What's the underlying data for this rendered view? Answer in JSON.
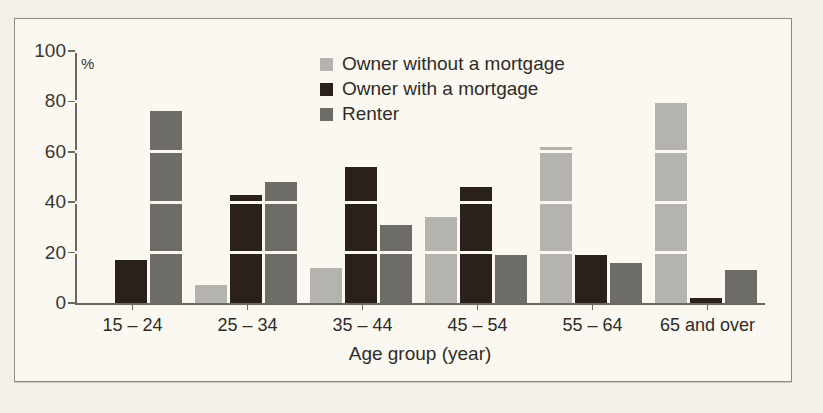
{
  "chart_data": {
    "type": "bar",
    "title": "",
    "xlabel": "Age group (year)",
    "ylabel": "%",
    "ylim": [
      0,
      100
    ],
    "yticks": [
      0,
      20,
      40,
      60,
      80,
      100
    ],
    "grid": true,
    "legend_position": "top-center",
    "categories": [
      "15 – 24",
      "25 – 34",
      "35 – 44",
      "45 – 54",
      "55 – 64",
      "65 and over"
    ],
    "series": [
      {
        "name": "Owner without a mortgage",
        "color": "#b5b3ad",
        "values": [
          0,
          7,
          14,
          34,
          62,
          80
        ]
      },
      {
        "name": "Owner with a mortgage",
        "color": "#2a201c",
        "values": [
          17,
          43,
          54,
          46,
          19,
          2
        ]
      },
      {
        "name": "Renter",
        "color": "#6e6c66",
        "values": [
          76,
          48,
          31,
          19,
          16,
          13
        ]
      }
    ]
  },
  "legend": [
    {
      "label": "Owner without a mortgage"
    },
    {
      "label": "Owner with a mortgage"
    },
    {
      "label": "Renter"
    }
  ],
  "axes": {
    "y_unit": "%",
    "y_tick_labels": [
      "0",
      "20",
      "40",
      "60",
      "80",
      "100"
    ],
    "x_title": "Age group (year)",
    "x_tick_labels": [
      "15 – 24",
      "25 – 34",
      "35 – 44",
      "45 – 54",
      "55 – 64",
      "65 and over"
    ]
  },
  "colors": {
    "background": "#faf8f1",
    "page": "#f2f0e8",
    "border": "#8e8b84",
    "axis": "#6b6862",
    "text": "#2f2c27",
    "series_light": "#b5b3ad",
    "series_dark": "#2a201c",
    "series_mid": "#6e6c66"
  }
}
